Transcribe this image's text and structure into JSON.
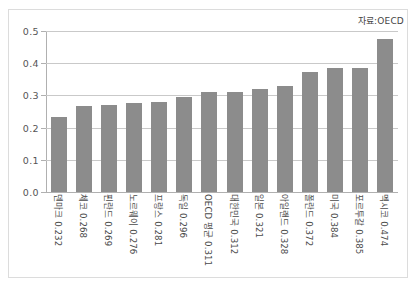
{
  "source_note": "자료:OECD",
  "chart_data": {
    "type": "bar",
    "title": "",
    "subtitle": "",
    "xlabel": "",
    "ylabel": "",
    "ylim": [
      0.0,
      0.5
    ],
    "grid": true,
    "legend": null,
    "annotations": [
      "자료:OECD"
    ],
    "ytick_labels": [
      "0.5",
      "0.4",
      "0.3",
      "0.2",
      "0.1",
      "0.0"
    ],
    "ytick_values": [
      0.5,
      0.4,
      0.3,
      0.2,
      0.1,
      0.0
    ],
    "bar_color": "#8c8c8c",
    "categories": [
      "덴마크",
      "체코",
      "핀란드",
      "노르웨이",
      "프랑스",
      "독일",
      "OECD 평균",
      "대한민국",
      "일본",
      "아일랜드",
      "폴란드",
      "미국",
      "포르투갈",
      "멕시코"
    ],
    "values": [
      0.232,
      0.268,
      0.269,
      0.276,
      0.281,
      0.296,
      0.311,
      0.312,
      0.321,
      0.328,
      0.372,
      0.384,
      0.385,
      0.474
    ],
    "tick_labels": [
      "덴마크 0.232",
      "체코 0.268",
      "핀란드 0.269",
      "노르웨이 0.276",
      "프랑스 0.281",
      "독일 0.296",
      "OECD 평균 0.311",
      "대한민국 0.312",
      "일본 0.321",
      "아일랜드 0.328",
      "폴란드 0.372",
      "미국 0.384",
      "포르투갈 0.385",
      "멕시코 0.474"
    ]
  }
}
